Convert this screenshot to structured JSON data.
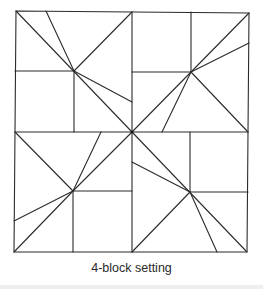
{
  "caption": "4-block setting",
  "diagram": {
    "type": "quilt-block-layout",
    "blocks_count": 4,
    "stroke_color": "#2b2b2b",
    "outer_square": {
      "x1": 15,
      "y1": 12,
      "x2": 248,
      "y2": 252
    },
    "center": [
      132,
      132
    ],
    "block_centers": {
      "top_left": [
        74,
        71
      ],
      "top_right": [
        191,
        72
      ],
      "bottom_left": [
        73,
        191
      ],
      "bottom_right": [
        190,
        192
      ]
    }
  }
}
